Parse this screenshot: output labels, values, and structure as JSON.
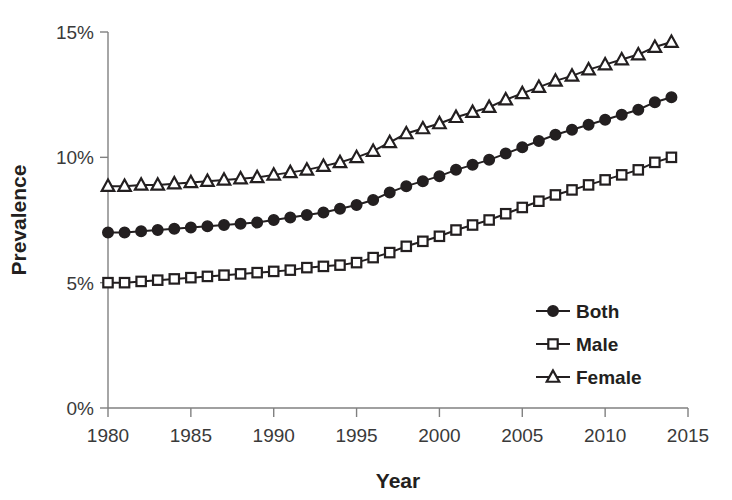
{
  "chart_data": {
    "type": "line",
    "title": "",
    "subtitle": "",
    "xlabel": "Year",
    "ylabel": "Prevalence",
    "xlim": [
      1980,
      2015
    ],
    "ylim": [
      0,
      15
    ],
    "grid": false,
    "legend_position": "inside-lower-right",
    "x_tick_labels": [
      "1980",
      "1985",
      "1990",
      "1995",
      "2000",
      "2005",
      "2010",
      "2015"
    ],
    "x_ticks": [
      1980,
      1985,
      1990,
      1995,
      2000,
      2005,
      2010,
      2015
    ],
    "y_tick_labels": [
      "0%",
      "5%",
      "10%",
      "15%"
    ],
    "y_ticks": [
      0,
      5,
      10,
      15
    ],
    "x": [
      1980,
      1981,
      1982,
      1983,
      1984,
      1985,
      1986,
      1987,
      1988,
      1989,
      1990,
      1991,
      1992,
      1993,
      1994,
      1995,
      1996,
      1997,
      1998,
      1999,
      2000,
      2001,
      2002,
      2003,
      2004,
      2005,
      2006,
      2007,
      2008,
      2009,
      2010,
      2011,
      2012,
      2013,
      2014
    ],
    "series": [
      {
        "name": "Both",
        "marker": "filled-circle",
        "values": [
          7.0,
          7.0,
          7.05,
          7.1,
          7.15,
          7.2,
          7.25,
          7.3,
          7.35,
          7.4,
          7.5,
          7.6,
          7.7,
          7.8,
          7.95,
          8.1,
          8.3,
          8.6,
          8.85,
          9.05,
          9.25,
          9.5,
          9.7,
          9.9,
          10.15,
          10.4,
          10.65,
          10.9,
          11.1,
          11.3,
          11.5,
          11.7,
          11.9,
          12.2,
          12.4
        ]
      },
      {
        "name": "Male",
        "marker": "open-square",
        "values": [
          5.0,
          5.0,
          5.05,
          5.1,
          5.15,
          5.2,
          5.25,
          5.3,
          5.35,
          5.4,
          5.45,
          5.5,
          5.6,
          5.65,
          5.7,
          5.8,
          6.0,
          6.2,
          6.45,
          6.65,
          6.85,
          7.1,
          7.3,
          7.5,
          7.75,
          8.0,
          8.25,
          8.5,
          8.7,
          8.9,
          9.1,
          9.3,
          9.5,
          9.8,
          10.0
        ]
      },
      {
        "name": "Female",
        "marker": "open-triangle",
        "values": [
          8.85,
          8.85,
          8.9,
          8.9,
          8.95,
          9.0,
          9.05,
          9.1,
          9.15,
          9.2,
          9.3,
          9.4,
          9.5,
          9.65,
          9.8,
          10.0,
          10.25,
          10.6,
          10.95,
          11.15,
          11.35,
          11.6,
          11.8,
          12.0,
          12.3,
          12.55,
          12.8,
          13.05,
          13.25,
          13.5,
          13.7,
          13.9,
          14.1,
          14.4,
          14.6
        ]
      }
    ]
  },
  "legend": {
    "items": [
      {
        "label": "Both"
      },
      {
        "label": "Male"
      },
      {
        "label": "Female"
      }
    ]
  },
  "colors": {
    "series": "#231f20",
    "axis": "#808080",
    "background": "#ffffff"
  }
}
